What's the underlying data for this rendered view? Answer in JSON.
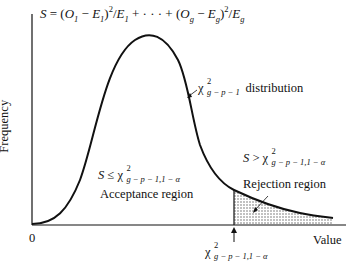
{
  "title": {
    "formula": "S = (O1 − E1)²/E1 + · · · + (Og − Eg)²/Eg",
    "S": "S",
    "eq": " = (",
    "O1": "O",
    "O1_sub": "1",
    "minus1": " − ",
    "E1": "E",
    "E1_sub": "1",
    "close1": ")",
    "sq1": "2",
    "div1": "/",
    "E1b": "E",
    "E1b_sub": "1",
    "dots": " + · · · + (",
    "Og": "O",
    "Og_sub": "g",
    "minus2": " − ",
    "Eg": "E",
    "Eg_sub": "g",
    "close2": ")",
    "sq2": "2",
    "div2": "/",
    "Egb": "E",
    "Egb_sub": "g"
  },
  "axes": {
    "y_label": "Frequency",
    "x_label": "Value",
    "origin_label": "0"
  },
  "curve_label": {
    "chi": "χ",
    "sup": "2",
    "sub": "g − p − 1",
    "text": "distribution"
  },
  "acceptance": {
    "condition_S": "S",
    "condition_op": " ≤ ",
    "chi": "χ",
    "sup": "2",
    "sub": "g − p − 1,1 − α",
    "label": "Acceptance region"
  },
  "rejection": {
    "condition_S": "S",
    "condition_op": " > ",
    "chi": "χ",
    "sup": "2",
    "sub": "g − p − 1,1 − α",
    "label": "Rejection region"
  },
  "critical_value": {
    "chi": "χ",
    "sup": "2",
    "sub": "g − p − 1,1 − α"
  },
  "colors": {
    "ink": "#111111",
    "shade": "#bdbdbd",
    "background": "#ffffff"
  }
}
